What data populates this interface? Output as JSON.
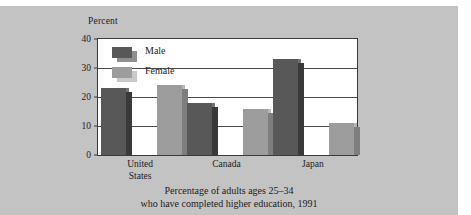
{
  "figure": {
    "background_color": "#c3c3c3",
    "plot_background": "#ffffff"
  },
  "legend": {
    "items": [
      {
        "label": "Male",
        "color": "#585858",
        "shadow": "#8f8f8f"
      },
      {
        "label": "Female",
        "color": "#9d9d9d",
        "shadow": "#c9c9c9"
      }
    ]
  },
  "caption": {
    "line1": "Percentage of adults ages 25–34",
    "line2": "who have completed higher education, 1991"
  },
  "chart_data": {
    "type": "bar",
    "title": "",
    "subtitle": "",
    "xlabel": "",
    "ylabel": "Percent",
    "ylim": [
      0,
      40
    ],
    "yticks": [
      0,
      10,
      20,
      30,
      40
    ],
    "grid": true,
    "legend_position": "inside-top-left",
    "categories": [
      "United States",
      "Canada",
      "Japan"
    ],
    "category_lines": [
      [
        "United",
        "States"
      ],
      [
        "Canada"
      ],
      [
        "Japan"
      ]
    ],
    "series": [
      {
        "name": "Male",
        "color": "#585858",
        "values": [
          23,
          18,
          33
        ]
      },
      {
        "name": "Female",
        "color": "#9d9d9d",
        "values": [
          24,
          16,
          11
        ]
      }
    ]
  }
}
